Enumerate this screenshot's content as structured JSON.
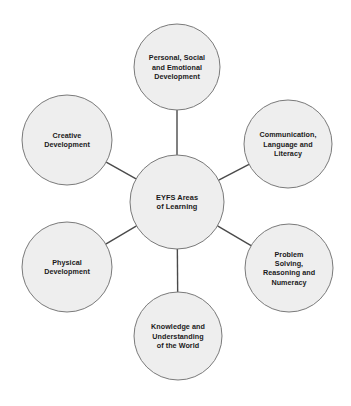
{
  "diagram": {
    "type": "hub-and-spoke",
    "background_color": "#ffffff",
    "node_fill_color": "#eeeeee",
    "node_border_color": "#7a7a7a",
    "connector_color": "#4a4a4a",
    "text_color": "#1a1a1a",
    "hub": {
      "id": "hub",
      "label": "EYFS Areas of Learning",
      "lines": [
        "EYFS Areas",
        "of Learning"
      ],
      "cx": 177,
      "cy": 202,
      "r": 47
    },
    "nodes": [
      {
        "id": "personal-social-emotional-development",
        "label": "Personal, Social and Emotional Development",
        "lines": [
          "Personal, Social",
          "and Emotional",
          "Development"
        ],
        "cx": 177,
        "cy": 67,
        "r": 43,
        "position": "top"
      },
      {
        "id": "communication-language-literacy",
        "label": "Communication, Language and Literacy",
        "lines": [
          "Communication,",
          "Language and",
          "Literacy"
        ],
        "cx": 288,
        "cy": 144,
        "r": 44,
        "position": "upper-right"
      },
      {
        "id": "problem-solving-reasoning-numeracy",
        "label": "Problem Solving, Reasoning and Numeracy",
        "lines": [
          "Problem",
          "Solving,",
          "Reasoning and",
          "Numeracy"
        ],
        "cx": 289,
        "cy": 268,
        "r": 44,
        "position": "lower-right"
      },
      {
        "id": "knowledge-understanding-world",
        "label": "Knowledge and Understanding of the World",
        "lines": [
          "Knowledge and",
          "Understanding",
          "of the World"
        ],
        "cx": 178,
        "cy": 336,
        "r": 44,
        "position": "bottom"
      },
      {
        "id": "physical-development",
        "label": "Physical Development",
        "lines": [
          "Physical",
          "Development"
        ],
        "cx": 67,
        "cy": 267,
        "r": 45,
        "position": "lower-left"
      },
      {
        "id": "creative-development",
        "label": "Creative Development",
        "lines": [
          "Creative",
          "Development"
        ],
        "cx": 67,
        "cy": 140,
        "r": 45,
        "position": "upper-left"
      }
    ],
    "connectors": [
      {
        "id": "hub-to-personal-social-emotional-development",
        "from": "hub",
        "to": "personal-social-emotional-development"
      },
      {
        "id": "hub-to-communication-language-literacy",
        "from": "hub",
        "to": "communication-language-literacy"
      },
      {
        "id": "hub-to-problem-solving-reasoning-numeracy",
        "from": "hub",
        "to": "problem-solving-reasoning-numeracy"
      },
      {
        "id": "hub-to-knowledge-understanding-world",
        "from": "hub",
        "to": "knowledge-understanding-world"
      },
      {
        "id": "hub-to-physical-development",
        "from": "hub",
        "to": "physical-development"
      },
      {
        "id": "hub-to-creative-development",
        "from": "hub",
        "to": "creative-development"
      }
    ]
  }
}
